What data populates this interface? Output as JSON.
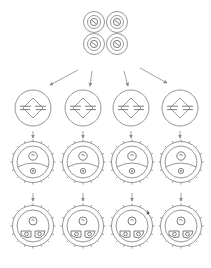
{
  "diagram": {
    "title": "",
    "stroke_color": "#8a8a8a",
    "background": "#ffffff",
    "source_cluster": {
      "label": "",
      "cells": [
        {
          "cx": 94,
          "cy": 22
        },
        {
          "cx": 117,
          "cy": 22
        },
        {
          "cx": 94,
          "cy": 44
        },
        {
          "cx": 117,
          "cy": 44
        }
      ]
    },
    "columns": [
      {
        "id": 1,
        "cx": 33
      },
      {
        "id": 2,
        "cx": 83
      },
      {
        "id": 3,
        "cx": 131
      },
      {
        "id": 4,
        "cx": 180
      }
    ],
    "rows": [
      {
        "name": "stage-2-dividing-cells",
        "cy": 108,
        "label": ""
      },
      {
        "name": "stage-3-cells-single-compartment",
        "cy": 162,
        "label": ""
      },
      {
        "name": "stage-4-cells-two-compartments",
        "cy": 226,
        "label": ""
      }
    ]
  }
}
